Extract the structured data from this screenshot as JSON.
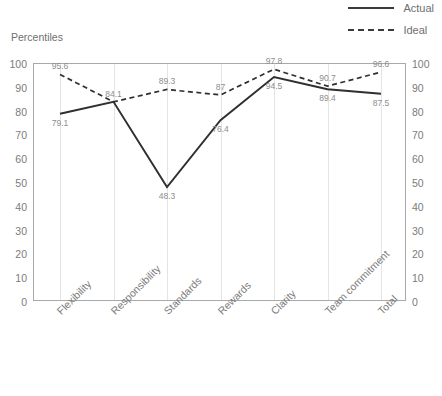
{
  "axis_title": "Percentiles",
  "legend": {
    "position": "top-right",
    "items": [
      {
        "label": "Actual",
        "style": "solid",
        "icon": "solid-line-icon"
      },
      {
        "label": "Ideal",
        "style": "dashed",
        "icon": "dashed-line-icon"
      }
    ]
  },
  "chart_data": {
    "type": "line",
    "title": "",
    "subtitle": "",
    "xlabel": "",
    "ylabel": "Percentiles",
    "ylim": [
      0,
      100
    ],
    "yticks": [
      0,
      10,
      20,
      30,
      40,
      50,
      60,
      70,
      80,
      90,
      100
    ],
    "y_axis_right_mirrored": true,
    "grid": {
      "vertical": true,
      "horizontal": false
    },
    "legend_position": "top-right",
    "categories": [
      "Flexibility",
      "Responsibility",
      "Standards",
      "Rewards",
      "Clarity",
      "Team commitment",
      "Total"
    ],
    "series": [
      {
        "name": "Actual",
        "style": "solid",
        "color": "#2f2f2f",
        "values": [
          79.1,
          84.1,
          48.3,
          76.4,
          94.5,
          89.4,
          87.5
        ],
        "labels": [
          "79.1",
          "84.1",
          "48.3",
          "76.4",
          "94.5",
          "89.4",
          "87.5"
        ]
      },
      {
        "name": "Ideal",
        "style": "dashed",
        "color": "#2f2f2f",
        "values": [
          95.6,
          84.1,
          89.3,
          87,
          97.8,
          90.7,
          96.6
        ],
        "labels": [
          "95.6",
          "84.1",
          "89.3",
          "87",
          "97.8",
          "90.7",
          "96.6"
        ]
      }
    ]
  },
  "colors": {
    "line": "#2f2f2f",
    "grid": "#e4e4e4",
    "frame": "#a9a9a9",
    "text": "#7b7b7b",
    "label_text": "#8d8d8d",
    "background": "#ffffff"
  },
  "footer_clipped_text": ""
}
